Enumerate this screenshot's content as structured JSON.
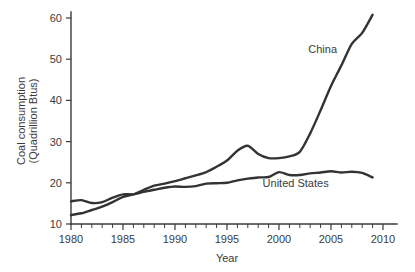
{
  "chart_data": {
    "type": "line",
    "title": "",
    "xlabel": "Year",
    "ylabel": "Coal consumption (Quadrillion Btus)",
    "ylabel_line1": "Coal consumption",
    "ylabel_line2": "(Quadrillion Btus)",
    "xlim": [
      1979,
      2011
    ],
    "ylim": [
      10,
      62
    ],
    "grid": false,
    "legend_position": "inline-annotation",
    "x_ticks_major": [
      1980,
      1985,
      1990,
      1995,
      2000,
      2005,
      2010
    ],
    "x_tick_labels": [
      "1980",
      "1985",
      "1990",
      "1995",
      "2000",
      "2005",
      "2010"
    ],
    "x_minor_tick_interval": 1,
    "y_ticks": [
      10,
      20,
      30,
      40,
      50,
      60
    ],
    "y_tick_labels": [
      "10",
      "20",
      "30",
      "40",
      "50",
      "60"
    ],
    "x": [
      1980,
      1981,
      1982,
      1983,
      1984,
      1985,
      1986,
      1987,
      1988,
      1989,
      1990,
      1991,
      1992,
      1993,
      1994,
      1995,
      1996,
      1997,
      1998,
      1999,
      2000,
      2001,
      2002,
      2003,
      2004,
      2005,
      2006,
      2007,
      2008,
      2009
    ],
    "series": [
      {
        "name": "China",
        "color": "#333333",
        "label_x": 2004.2,
        "label_y": 51.5,
        "values": [
          12.2,
          12.6,
          13.4,
          14.2,
          15.3,
          16.6,
          17.2,
          18.3,
          19.3,
          19.8,
          20.4,
          21.1,
          21.8,
          22.6,
          23.9,
          25.4,
          27.8,
          29.0,
          27.0,
          26.0,
          26.0,
          26.4,
          27.5,
          32.0,
          37.6,
          43.5,
          48.5,
          53.7,
          56.4,
          60.8
        ]
      },
      {
        "name": "United States",
        "color": "#333333",
        "label_x": 2001.6,
        "label_y": 19.0,
        "values": [
          15.5,
          15.8,
          15.1,
          15.3,
          16.4,
          17.2,
          17.2,
          17.8,
          18.3,
          18.8,
          19.1,
          19.0,
          19.2,
          19.8,
          19.9,
          20.0,
          20.6,
          21.0,
          21.3,
          21.4,
          22.6,
          21.9,
          21.9,
          22.3,
          22.5,
          22.8,
          22.5,
          22.7,
          22.4,
          21.3
        ]
      }
    ]
  }
}
